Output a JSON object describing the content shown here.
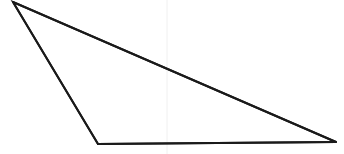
{
  "figure": {
    "kind": "geometry-line-drawing",
    "shape_name": "scalene-triangle",
    "background_color": "#ffffff",
    "stroke_color": "#1a1a1a",
    "stroke_width": 2,
    "canvas": {
      "width": 344,
      "height": 154
    },
    "vertices": [
      {
        "name": "top-left-apex",
        "x": 13,
        "y": 2
      },
      {
        "name": "bottom-left",
        "x": 98,
        "y": 144
      },
      {
        "name": "bottom-right",
        "x": 336,
        "y": 142
      }
    ],
    "edges": [
      {
        "name": "upper-hypotenuse",
        "from": "top-left-apex",
        "to": "bottom-right"
      },
      {
        "name": "left-side",
        "from": "top-left-apex",
        "to": "bottom-left"
      },
      {
        "name": "base",
        "from": "bottom-left",
        "to": "bottom-right"
      }
    ],
    "guide_line": {
      "name": "vertical-guide",
      "x": 167,
      "y_start": 0,
      "y_end": 154,
      "color": "#f0f0f0",
      "width": 1
    },
    "labels": []
  }
}
